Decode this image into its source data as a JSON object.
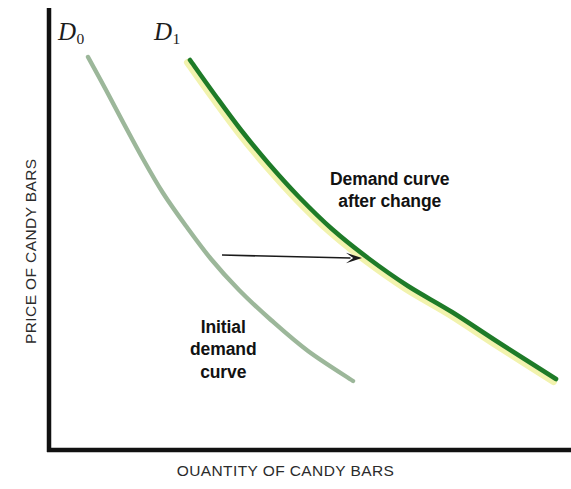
{
  "chart_data": {
    "type": "line",
    "title": "",
    "xlabel": "OUANTITY OF CANDY BARS",
    "ylabel": "PRICE OF CANDY BARS",
    "grid": false,
    "legend_position": "inline-labels",
    "axes": {
      "x_ticks": [],
      "y_ticks": [],
      "x_axis_arrow": false,
      "y_axis_arrow": false,
      "origin_px": [
        47,
        452
      ]
    },
    "series": [
      {
        "name": "D0",
        "label": "D",
        "subscript": "0",
        "description": "Initial demand curve",
        "color": "#9cb79a",
        "points": [
          [
            88,
            57
          ],
          [
            106,
            90
          ],
          [
            124,
            124
          ],
          [
            143,
            159
          ],
          [
            163,
            193
          ],
          [
            186,
            226
          ],
          [
            211,
            259
          ],
          [
            239,
            290
          ],
          [
            271,
            320
          ],
          [
            308,
            351
          ],
          [
            353,
            381
          ]
        ]
      },
      {
        "name": "D1",
        "label": "D",
        "subscript": "1",
        "description": "Demand curve after change",
        "color": "#1e7b28",
        "edge_color": "#f2f3ae",
        "points": [
          [
            190,
            60
          ],
          [
            215,
            95
          ],
          [
            241,
            130
          ],
          [
            269,
            164
          ],
          [
            299,
            197
          ],
          [
            332,
            229
          ],
          [
            368,
            258
          ],
          [
            408,
            286
          ],
          [
            452,
            312
          ],
          [
            501,
            344
          ],
          [
            556,
            379
          ]
        ]
      }
    ],
    "annotations": [
      {
        "name": "demand-curve-after-change",
        "text": "Demand curve\nafter change",
        "x": 410,
        "y": 190
      },
      {
        "name": "initial-demand-curve",
        "text": "Initial\ndemand\ncurve",
        "x": 230,
        "y": 355
      }
    ],
    "arrow": {
      "name": "shift-arrow",
      "from": [
        222,
        255
      ],
      "to": [
        362,
        258
      ],
      "color": "#1a1a1a",
      "direction": "right"
    }
  },
  "labels": {
    "x_axis": "OUANTITY OF CANDY BARS",
    "y_axis": "PRICE OF CANDY BARS",
    "d0_letter": "D",
    "d0_sub": "0",
    "d1_letter": "D",
    "d1_sub": "1",
    "annotation_after_change": "Demand curve\nafter change",
    "annotation_initial": "Initial\ndemand\ncurve"
  },
  "colors": {
    "initial_curve": "#9cb79a",
    "shifted_curve": "#1e7b28",
    "shifted_curve_edge": "#f2f3ae",
    "axis": "#111111",
    "text": "#121212",
    "background": "#ffffff"
  }
}
